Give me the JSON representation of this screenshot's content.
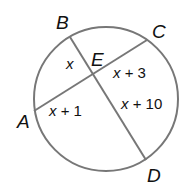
{
  "diagram": {
    "type": "circle-intersecting-chords",
    "colors": {
      "stroke": "#777777",
      "text": "#111111",
      "background": "#ffffff"
    },
    "circle": {
      "cx": 106,
      "cy": 99,
      "r": 72
    },
    "points": {
      "A": {
        "label": "A",
        "x": 34,
        "y": 111
      },
      "B": {
        "label": "B",
        "x": 70,
        "y": 37
      },
      "C": {
        "label": "C",
        "x": 147,
        "y": 40
      },
      "D": {
        "label": "D",
        "x": 146,
        "y": 160
      },
      "E": {
        "label": "E",
        "x": 93,
        "y": 75
      }
    },
    "chords": [
      {
        "name": "AC",
        "from": "A",
        "to": "C"
      },
      {
        "name": "BD",
        "from": "B",
        "to": "D"
      }
    ],
    "segment_labels": {
      "BE": {
        "var": "x",
        "rest": ""
      },
      "EC": {
        "var": "x",
        "rest": " + 3"
      },
      "AE": {
        "var": "x",
        "rest": " + 1"
      },
      "ED": {
        "var": "x",
        "rest": " + 10"
      }
    }
  }
}
